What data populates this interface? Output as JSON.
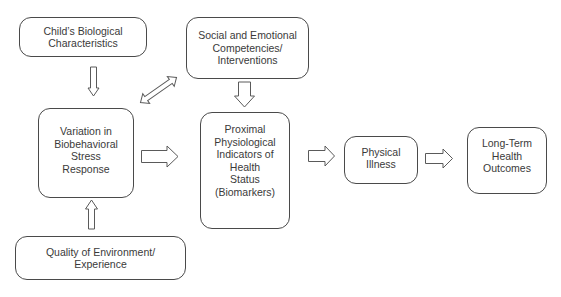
{
  "diagram": {
    "nodes": [
      {
        "id": "child-bio",
        "label": "Child’s Biological\nCharacteristics"
      },
      {
        "id": "social-emotional",
        "label": "Social and Emotional\nCompetencies/\nInterventions"
      },
      {
        "id": "variation-stress",
        "label": "Variation in\nBiobehavioral\nStress\nResponse"
      },
      {
        "id": "proximal-indicators",
        "label": "Proximal\nPhysiological\nIndicators of\nHealth\nStatus\n(Biomarkers)"
      },
      {
        "id": "physical-illness",
        "label": "Physical\nIllness"
      },
      {
        "id": "long-term",
        "label": "Long-Term\nHealth\nOutcomes"
      },
      {
        "id": "quality-env",
        "label": "Quality of Environment/\nExperience"
      }
    ],
    "edges": [
      {
        "from": "child-bio",
        "to": "variation-stress",
        "type": "block-arrow-down"
      },
      {
        "from": "quality-env",
        "to": "variation-stress",
        "type": "block-arrow-up"
      },
      {
        "from": "variation-stress",
        "to": "social-emotional",
        "type": "double-arrow-diagonal"
      },
      {
        "from": "social-emotional",
        "to": "proximal-indicators",
        "type": "block-arrow-down"
      },
      {
        "from": "variation-stress",
        "to": "proximal-indicators",
        "type": "block-arrow-right"
      },
      {
        "from": "proximal-indicators",
        "to": "physical-illness",
        "type": "block-arrow-right"
      },
      {
        "from": "physical-illness",
        "to": "long-term",
        "type": "block-arrow-right"
      }
    ]
  }
}
